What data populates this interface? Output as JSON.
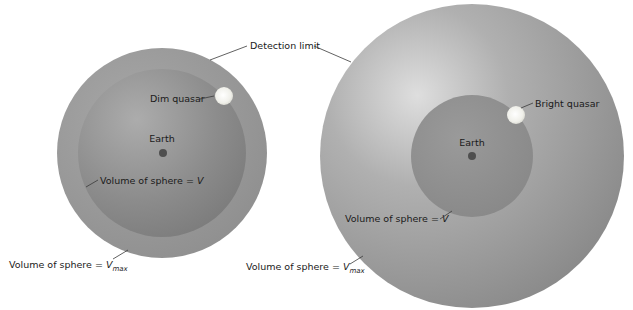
{
  "diagram": {
    "detection_limit_label": "Detection limit",
    "left_panel": {
      "name": "dim-quasar-case",
      "quasar_label": "Dim quasar",
      "earth_label": "Earth",
      "inner_volume_label": "Volume of sphere = ",
      "inner_volume_symbol": "V",
      "outer_volume_label": "Volume of sphere = ",
      "outer_volume_symbol": "V",
      "outer_volume_subscript": "max"
    },
    "right_panel": {
      "name": "bright-quasar-case",
      "quasar_label": "Bright quasar",
      "earth_label": "Earth",
      "inner_volume_label": "Volume of sphere = ",
      "inner_volume_symbol": "V",
      "outer_volume_label": "Volume of sphere = ",
      "outer_volume_symbol": "V",
      "outer_volume_subscript": "max"
    },
    "colors": {
      "background": "#ffffff",
      "outer_sphere_light": "#dcdcdc",
      "outer_sphere_mid": "#a0a0a0",
      "outer_sphere_dark": "#858585",
      "inner_sphere_light": "#aaaaaa",
      "inner_sphere_dark": "#7c7c7c",
      "earth": "#4f4f4f",
      "quasar": "#f4f4ee",
      "leader_line": "#3a3a3a",
      "text": "#1a1a1a"
    }
  }
}
